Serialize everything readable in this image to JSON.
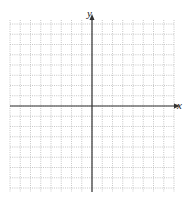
{
  "figure": {
    "type": "coordinate-grid",
    "x_axis_label": "x",
    "y_axis_label": "y",
    "grid": {
      "left": 10,
      "top": 20,
      "right": 174,
      "bottom": 192,
      "origin_x": 92,
      "origin_y": 106,
      "cell_size": 10.25,
      "cells_left": 8,
      "cells_right": 8,
      "cells_up": 8,
      "cells_down": 8
    },
    "colors": {
      "grid_line": "#b8b8b8",
      "axis": "#333333",
      "background": "#ffffff"
    }
  }
}
